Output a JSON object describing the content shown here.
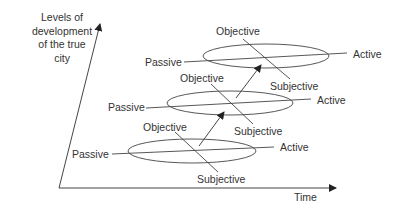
{
  "diagram": {
    "y_axis_label": "Levels of development of the true city",
    "x_axis_label": "Time",
    "levels": [
      {
        "name": "level-1",
        "passive": "Passive",
        "active": "Active",
        "objective": "Objective",
        "subjective": "Subjective"
      },
      {
        "name": "level-2",
        "passive": "Passive",
        "active": "Active",
        "objective": "Objective",
        "subjective": "Subjective"
      },
      {
        "name": "level-3",
        "passive": "Passive",
        "active": "Active",
        "objective": "Objective",
        "subjective": "Subjective"
      }
    ],
    "colors": {
      "line": "#333333",
      "text": "#333333",
      "background": "#ffffff"
    }
  }
}
